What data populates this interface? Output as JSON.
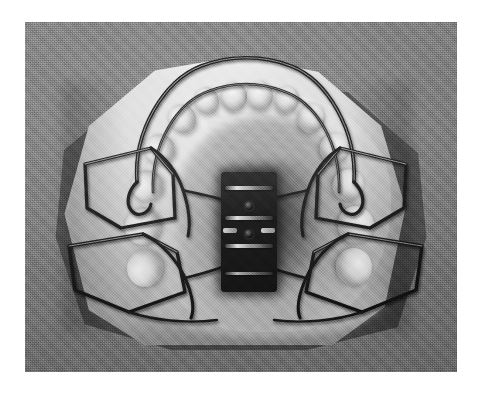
{
  "image": {
    "kind": "photograph",
    "subject": "removable maxillary orthodontic appliance seated on a plaster dental cast",
    "alt_text": "Black-and-white occlusal photograph of an upper removable expansion plate with a midline jackscrew, Adams clasps and a labial bow, mounted on a trimmed plaster study cast against a grey fabric background.",
    "color_mode": "grayscale",
    "caption": ""
  },
  "frame": {
    "page_background": "#ffffff",
    "photo": {
      "x": 25,
      "y": 22,
      "width": 432,
      "height": 350
    },
    "border_color": "#ffffff"
  },
  "palette": {
    "backdrop_grey": "#808080",
    "backdrop_dark": "#6a6a6a",
    "cast_highlight": "#f3f2ee",
    "cast_midtone": "#cfcdc7",
    "cast_shadow": "#b7b4ad",
    "palate_shadow": "#3a3a3a",
    "wire_dark": "#141414",
    "wire_highlight": "#efefef",
    "screw_black": "#0c0c0c",
    "screw_metal": "#e9e9e9"
  },
  "scene": {
    "backdrop": {
      "label": "grey textured cloth backdrop",
      "texture": "fine woven / halftone grain"
    },
    "cast": {
      "label": "plaster maxillary cast",
      "shape": "trimmed polygonal base",
      "bounds": {
        "x": 36,
        "y": 34,
        "width": 348,
        "height": 292
      }
    },
    "shadow": {
      "label": "cast drop shadow",
      "direction": "lower-left"
    }
  },
  "appliance": {
    "name": "upper removable expansion plate",
    "components": [
      {
        "id": "baseplate",
        "label": "acrylic baseplate",
        "material": "clear acrylic resin",
        "finish": "translucent"
      },
      {
        "id": "jackscrew",
        "label": "midline expansion screw",
        "material": "stainless steel",
        "position": "palatal midline",
        "bars": 4,
        "holes": 2
      },
      {
        "id": "labial-bow",
        "label": "anterior labial bow",
        "material": "stainless steel wire",
        "span": "canine to canine"
      },
      {
        "id": "clasp-ul",
        "label": "Adams clasp upper left premolar",
        "side": "left",
        "region": "premolar"
      },
      {
        "id": "clasp-ur",
        "label": "Adams clasp upper right premolar",
        "side": "right",
        "region": "premolar"
      },
      {
        "id": "clasp-ll",
        "label": "Adams clasp upper left molar",
        "side": "left",
        "region": "molar"
      },
      {
        "id": "clasp-lr",
        "label": "Adams clasp upper right molar",
        "side": "right",
        "region": "molar"
      },
      {
        "id": "arrowhead-l",
        "label": "arrowhead retention loop left"
      },
      {
        "id": "arrowhead-r",
        "label": "arrowhead retention loop right"
      }
    ]
  },
  "anatomy": {
    "palate": {
      "label": "palatal vault",
      "appearance": "deep shadowed concavity"
    },
    "rugae": {
      "label": "palatal rugae",
      "appearance": "ridged folds behind the incisors"
    },
    "teeth": [
      {
        "id": "t-ur-central",
        "label": "upper right central incisor"
      },
      {
        "id": "t-ul-central",
        "label": "upper left central incisor"
      },
      {
        "id": "t-ur-lateral",
        "label": "upper right lateral incisor"
      },
      {
        "id": "t-ul-lateral",
        "label": "upper left lateral incisor"
      },
      {
        "id": "t-ur-canine",
        "label": "upper right canine"
      },
      {
        "id": "t-ul-canine",
        "label": "upper left canine"
      },
      {
        "id": "t-ur-pm1",
        "label": "upper right first premolar"
      },
      {
        "id": "t-ul-pm1",
        "label": "upper left first premolar"
      },
      {
        "id": "t-ur-pm2",
        "label": "upper right second premolar"
      },
      {
        "id": "t-ul-pm2",
        "label": "upper left second premolar"
      },
      {
        "id": "t-ur-m1",
        "label": "upper right first molar"
      },
      {
        "id": "t-ul-m1",
        "label": "upper left first molar"
      },
      {
        "id": "t-ur-m2",
        "label": "upper right second molar"
      },
      {
        "id": "t-ul-m2",
        "label": "upper left second molar"
      }
    ]
  }
}
